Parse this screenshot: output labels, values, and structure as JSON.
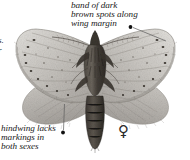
{
  "figure": {
    "sex_symbol": "♀",
    "sex_symbol_name": "female-symbol"
  },
  "annotations": {
    "top": {
      "name": "annotation-wing-margin",
      "line1": "band of dark",
      "line2": "brown spots along",
      "line3": "wing margin"
    },
    "bottom": {
      "name": "annotation-hindwing",
      "line1": "hindwing lacks",
      "line2": "markings in",
      "line3": "both sexes"
    },
    "left_fragment": {
      "line1": "s.",
      "line2": "r"
    }
  },
  "colors": {
    "background": "#ffffff",
    "text": "#1a1a1a",
    "leader_line": "#5a5a5a",
    "bullet": "#111111",
    "wing_light": "#d6d4d0",
    "wing_mid": "#b4b1ac",
    "wing_dark": "#8e8a85",
    "body_dark": "#4a453f",
    "body_darkest": "#2e2a26"
  }
}
